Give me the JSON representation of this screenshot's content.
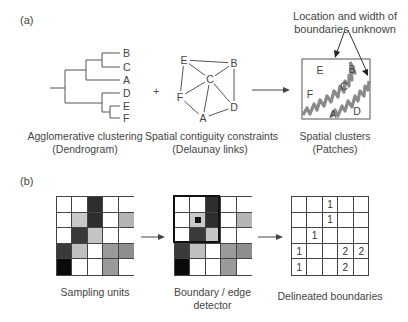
{
  "panel_a": {
    "label": "(a)",
    "dendrogram": {
      "caption_line1": "Agglomerative clustering",
      "caption_line2": "(Dendrogram)",
      "leaves": [
        "B",
        "C",
        "A",
        "D",
        "E",
        "F"
      ]
    },
    "plus_sign": "+",
    "network": {
      "caption_line1": "Spatial contiguity constraints",
      "caption_line2": "(Delaunay links)",
      "nodes": [
        {
          "id": "E",
          "x": 184,
          "y": 60
        },
        {
          "id": "B",
          "x": 234,
          "y": 63
        },
        {
          "id": "C",
          "x": 210,
          "y": 79
        },
        {
          "id": "F",
          "x": 180,
          "y": 97
        },
        {
          "id": "D",
          "x": 234,
          "y": 107
        },
        {
          "id": "A",
          "x": 203,
          "y": 118
        }
      ],
      "edges": [
        [
          "E",
          "B"
        ],
        [
          "E",
          "C"
        ],
        [
          "E",
          "F"
        ],
        [
          "B",
          "C"
        ],
        [
          "B",
          "D"
        ],
        [
          "C",
          "F"
        ],
        [
          "C",
          "D"
        ],
        [
          "C",
          "A"
        ],
        [
          "F",
          "A"
        ],
        [
          "A",
          "D"
        ]
      ]
    },
    "arrow_label": "",
    "patches": {
      "caption_line1": "Spatial clusters",
      "caption_line2": "(Patches)",
      "annotation_line1": "Location and width of",
      "annotation_line2": "boundaries unknown",
      "labels": [
        {
          "id": "E",
          "x": 320,
          "y": 74
        },
        {
          "id": "B",
          "x": 352,
          "y": 73
        },
        {
          "id": "C",
          "x": 344,
          "y": 90
        },
        {
          "id": "F",
          "x": 310,
          "y": 98
        },
        {
          "id": "A",
          "x": 333,
          "y": 118
        },
        {
          "id": "D",
          "x": 357,
          "y": 115
        }
      ],
      "boundary_color": "#8a8a8a"
    }
  },
  "panel_b": {
    "label": "(b)",
    "sampling_units": {
      "caption": "Sampling units",
      "cells": [
        [
          "#ffffff",
          "#ffffff",
          "#2e2e2e",
          "#ffffff",
          "#ffffff"
        ],
        [
          "#ffffff",
          "#c8c8c8",
          "#2e2e2e",
          "#ffffff",
          "#b4b4b4"
        ],
        [
          "#ffffff",
          "#3a3a3a",
          "#c4c4c4",
          "#ffffff",
          "#ffffff"
        ],
        [
          "#3a3a3a",
          "#c0c0c0",
          "#ffffff",
          "#9a9a9a",
          "#8e8e8e"
        ],
        [
          "#0a0a0a",
          "#ffffff",
          "#ffffff",
          "#9a9a9a",
          "#ffffff"
        ]
      ]
    },
    "boundary_detector": {
      "caption_line1": "Boundary / edge",
      "caption_line2": "detector",
      "window": {
        "row": 0,
        "col": 0,
        "size": 3
      },
      "center_marker": {
        "row": 1,
        "col": 1,
        "color": "#111111"
      }
    },
    "delineated": {
      "caption": "Delineated boundaries",
      "cells": [
        [
          "",
          "",
          "1",
          "",
          ""
        ],
        [
          "",
          "",
          "1",
          "",
          ""
        ],
        [
          "",
          "1",
          "",
          "",
          ""
        ],
        [
          "1",
          "",
          "",
          "2",
          "2"
        ],
        [
          "1",
          "",
          "",
          "2",
          ""
        ]
      ]
    }
  }
}
